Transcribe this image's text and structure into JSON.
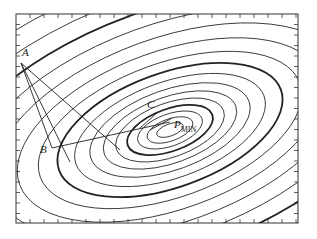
{
  "diagram": {
    "frame": {
      "x": 16,
      "y": 14,
      "width": 282,
      "height": 209
    },
    "center": {
      "x": 170,
      "y": 130
    },
    "rotation_deg": -20,
    "contours": [
      {
        "rx": 14,
        "ry": 6,
        "bold": false
      },
      {
        "rx": 24,
        "ry": 11,
        "bold": false
      },
      {
        "rx": 34,
        "ry": 16,
        "bold": false
      },
      {
        "rx": 45,
        "ry": 21,
        "bold": true
      },
      {
        "rx": 57,
        "ry": 27,
        "bold": false
      },
      {
        "rx": 70,
        "ry": 33,
        "bold": false
      },
      {
        "rx": 84,
        "ry": 40,
        "bold": false
      },
      {
        "rx": 100,
        "ry": 48,
        "bold": false
      },
      {
        "rx": 118,
        "ry": 57,
        "bold": true
      },
      {
        "rx": 138,
        "ry": 67,
        "bold": false
      },
      {
        "rx": 160,
        "ry": 79,
        "bold": false
      },
      {
        "rx": 185,
        "ry": 92,
        "bold": false
      },
      {
        "rx": 212,
        "ry": 106,
        "bold": false
      },
      {
        "rx": 242,
        "ry": 121,
        "bold": true
      },
      {
        "rx": 275,
        "ry": 138,
        "bold": false
      },
      {
        "rx": 312,
        "ry": 157,
        "bold": false
      }
    ],
    "points": [
      {
        "id": "A",
        "label": "A",
        "x": 21,
        "y": 63,
        "label_x": 22,
        "label_y": 56
      },
      {
        "id": "B",
        "label": "B",
        "x": 52,
        "y": 148,
        "label_x": 40,
        "label_y": 153
      },
      {
        "id": "C",
        "label": "C",
        "x": 158,
        "y": 106,
        "label_x": 147,
        "label_y": 108
      },
      {
        "id": "PMIN",
        "label": "P",
        "subscript": "MIN",
        "x": 170,
        "y": 130,
        "label_x": 174,
        "label_y": 128
      }
    ],
    "segments": [
      {
        "from": [
          21,
          63
        ],
        "to": [
          52,
          148
        ]
      },
      {
        "from": [
          21,
          63
        ],
        "to": [
          70,
          162
        ]
      },
      {
        "from": [
          21,
          63
        ],
        "to": [
          120,
          150
        ]
      },
      {
        "from": [
          52,
          148
        ],
        "to": [
          170,
          122
        ]
      },
      {
        "from": [
          140,
          128
        ],
        "to": [
          158,
          112
        ]
      },
      {
        "from": [
          150,
          130
        ],
        "to": [
          172,
          118
        ]
      }
    ],
    "ticks": {
      "top_bottom_spacing": 14,
      "left_right_spacing": 10.5,
      "length": 4
    }
  }
}
